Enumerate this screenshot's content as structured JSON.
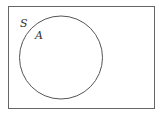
{
  "diagram": {
    "type": "venn",
    "universal_set": {
      "label": "S"
    },
    "sets": [
      {
        "label": "A"
      }
    ],
    "colors": {
      "stroke": "#555555",
      "text": "#333333",
      "background": "#ffffff"
    }
  }
}
